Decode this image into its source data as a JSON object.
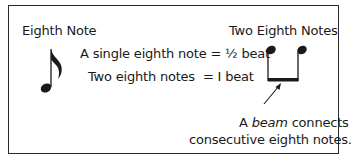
{
  "left_panel": {
    "title": "Eighth Note",
    "icon": "eighth-note-icon"
  },
  "right_panel": {
    "title": "Two Eighth Notes",
    "icon": "beamed-eighth-notes-icon"
  },
  "equations": {
    "line1": "A single eighth note = ½ beat",
    "line2_label": "Two eighth notes",
    "line2_value": "= I beat"
  },
  "annotation": {
    "prefix": "A ",
    "emphasis": "beam",
    "suffix": " connects",
    "line2": "consecutive eighth notes."
  },
  "colors": {
    "ink": "#1a1a1a",
    "border": "#2a2a2a",
    "background": "#ffffff"
  }
}
